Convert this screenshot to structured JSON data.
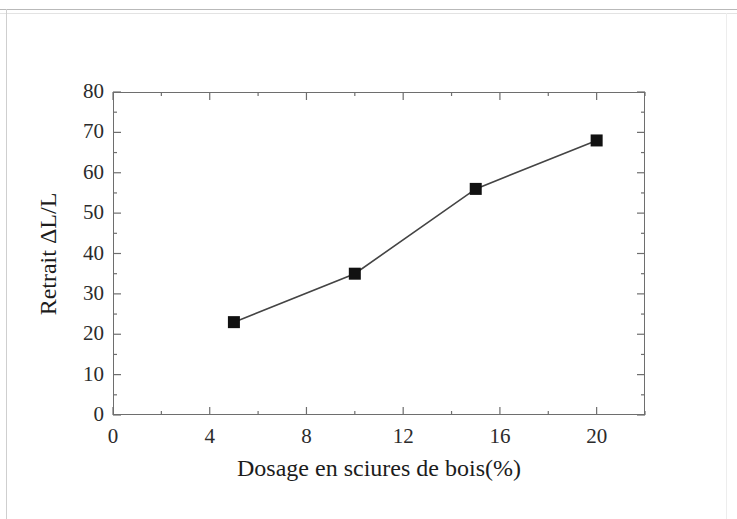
{
  "figure": {
    "background_color": "#ffffff",
    "frame_color": "#6e6e6e",
    "page_border_color": "#cfcfcf"
  },
  "chart_data": {
    "type": "line",
    "title": "",
    "subtitle": "",
    "xlabel": "Dosage en sciures de bois(%)",
    "ylabel": "Retrait ΔL/L",
    "xlim": [
      0,
      22
    ],
    "ylim": [
      0,
      80
    ],
    "grid": false,
    "legend": false,
    "legend_position": "none",
    "marker": "filled-square",
    "marker_color": "#111111",
    "line_color": "#444444",
    "x": [
      5,
      10,
      15,
      20
    ],
    "values": [
      23,
      35,
      56,
      68
    ],
    "series": [
      {
        "name": "Retrait ΔL/L",
        "x": [
          5,
          10,
          15,
          20
        ],
        "values": [
          23,
          35,
          56,
          68
        ]
      }
    ],
    "points": [
      {
        "x": 5,
        "y": 23
      },
      {
        "x": 10,
        "y": 35
      },
      {
        "x": 15,
        "y": 56
      },
      {
        "x": 20,
        "y": 68
      }
    ],
    "xticks": [
      0,
      4,
      8,
      12,
      16,
      20
    ],
    "xtick_labels": [
      "0",
      "4",
      "8",
      "12",
      "16",
      "20"
    ],
    "x_minor_ticks": [
      2,
      6,
      10,
      14,
      18,
      22
    ],
    "yticks": [
      0,
      10,
      20,
      30,
      40,
      50,
      60,
      70,
      80
    ],
    "ytick_labels": [
      "0",
      "10",
      "20",
      "30",
      "40",
      "50",
      "60",
      "70",
      "80"
    ],
    "y_minor_ticks": [
      5,
      15,
      25,
      35,
      45,
      55,
      65,
      75
    ]
  }
}
